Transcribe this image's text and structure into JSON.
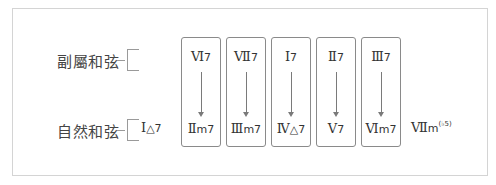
{
  "diagram": {
    "rows": {
      "secondary": {
        "label": "副屬和弦"
      },
      "natural": {
        "label": "自然和弦"
      }
    },
    "natural_first": {
      "roman": "Ⅰ",
      "quality": "△7"
    },
    "boxes": [
      {
        "top": {
          "roman": "Ⅵ",
          "quality": "7"
        },
        "bottom": {
          "roman": "Ⅱ",
          "quality": "m7"
        }
      },
      {
        "top": {
          "roman": "Ⅶ",
          "quality": "7"
        },
        "bottom": {
          "roman": "Ⅲ",
          "quality": "m7"
        }
      },
      {
        "top": {
          "roman": "Ⅰ",
          "quality": "7"
        },
        "bottom": {
          "roman": "Ⅳ",
          "quality": "△7"
        }
      },
      {
        "top": {
          "roman": "Ⅱ",
          "quality": "7"
        },
        "bottom": {
          "roman": "Ⅴ",
          "quality": "7"
        }
      },
      {
        "top": {
          "roman": "Ⅲ",
          "quality": "7"
        },
        "bottom": {
          "roman": "Ⅵ",
          "quality": "m7"
        }
      }
    ],
    "natural_last": {
      "roman": "Ⅶ",
      "quality": "m",
      "superscript": "(♭5)"
    }
  },
  "colors": {
    "frame": "#d4d4d4",
    "box_border": "#8a8a8a",
    "text": "#333333",
    "arrow": "#7a7a7a"
  }
}
